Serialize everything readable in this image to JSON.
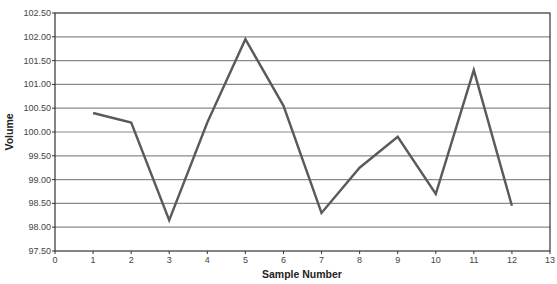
{
  "chart_data": {
    "type": "line",
    "title": "",
    "xlabel": "Sample Number",
    "ylabel": "Volume",
    "xlim": [
      0,
      13
    ],
    "ylim": [
      97.5,
      102.5
    ],
    "x_ticks": [
      0,
      1,
      2,
      3,
      4,
      5,
      6,
      7,
      8,
      9,
      10,
      11,
      12,
      13
    ],
    "y_ticks": [
      "97.50",
      "98.00",
      "98.50",
      "99.00",
      "99.50",
      "100.00",
      "100.50",
      "101.00",
      "101.50",
      "102.00",
      "102.50"
    ],
    "grid": "horizontal",
    "legend": "none",
    "series": [
      {
        "name": "Volume",
        "color": "#5a5a5a",
        "x": [
          1,
          2,
          3,
          4,
          5,
          6,
          7,
          8,
          9,
          10,
          11,
          12
        ],
        "values": [
          100.4,
          100.2,
          98.15,
          100.2,
          101.95,
          100.55,
          98.3,
          99.25,
          99.9,
          98.7,
          101.3,
          98.45
        ]
      }
    ]
  },
  "colors": {
    "line": "#5a5a5a",
    "grid": "#8a8a8a",
    "axis": "#333333"
  }
}
